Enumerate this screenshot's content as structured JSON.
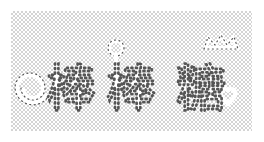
{
  "image": {
    "description": "Decorative white dotted-outline Chinese lettering on a transparent checkerboard background",
    "text": "棒棒糖",
    "characters": [
      "棒",
      "棒",
      "糖"
    ],
    "decorations": [
      "spiral-lollipop",
      "small-lollipop",
      "crown",
      "heart"
    ],
    "colors": {
      "glyph_fill": "#ffffff",
      "dot_outline": "#555555",
      "checker_light": "#ffffff",
      "checker_dark": "#d4d4d4"
    }
  }
}
